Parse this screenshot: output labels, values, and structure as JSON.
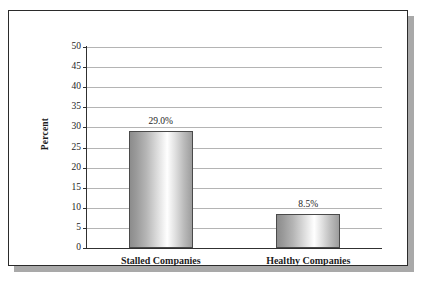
{
  "chart_data": {
    "type": "bar",
    "title": "",
    "xlabel": "",
    "ylabel": "Percent",
    "categories": [
      "Stalled Companies",
      "Healthy Companies"
    ],
    "values": [
      29.0,
      8.5
    ],
    "data_labels": [
      "29.0%",
      "8.5%"
    ],
    "ylim": [
      0,
      50
    ],
    "ytick_labels": [
      "50",
      "45",
      "40",
      "35",
      "30",
      "25",
      "20",
      "15",
      "10",
      "5",
      "0"
    ],
    "ytick_values": [
      50,
      45,
      40,
      35,
      30,
      25,
      20,
      15,
      10,
      5,
      0
    ],
    "grid": true,
    "legend": "none",
    "colors": {
      "bar_light": "#ffffff",
      "bar_dark": "#8c8c8c",
      "bar_outline": "#4a4a4a",
      "gridline": "#b4b4b4",
      "axis": "#303030",
      "text": "#1d1d1d",
      "frame_border": "#2b2b2b",
      "frame_shadow": "#a9a9a9",
      "background": "#ffffff"
    }
  }
}
